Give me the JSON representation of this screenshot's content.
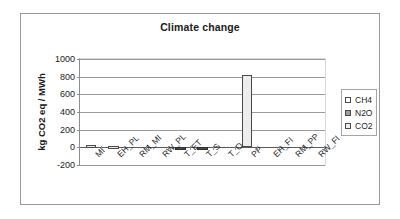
{
  "chart_data": {
    "type": "bar",
    "title": "Climate change",
    "xlabel": "",
    "ylabel": "kg CO2 eq / MWh",
    "ylim": [
      -200,
      1000
    ],
    "yticks": [
      1000,
      800,
      600,
      400,
      200,
      0,
      -200
    ],
    "grid": true,
    "legend_position": "right",
    "categories": [
      "MI",
      "EH_PL",
      "RM_MI",
      "RW_PL",
      "T_ET",
      "T_S",
      "T_O",
      "PP",
      "EH_FI",
      "RM_PP",
      "RW_FI"
    ],
    "series": [
      {
        "name": "CH4",
        "color": "#ffffff",
        "values": [
          0,
          0,
          0,
          0,
          0,
          0,
          0,
          0,
          0,
          0,
          0
        ]
      },
      {
        "name": "N2O",
        "color": "#9e9e9e",
        "values": [
          0,
          0,
          0,
          0,
          0,
          0,
          0,
          0,
          0,
          0,
          0
        ]
      },
      {
        "name": "CO2",
        "color": "#ededed",
        "values": [
          25,
          15,
          0,
          0,
          -10,
          -10,
          0,
          820,
          0,
          0,
          0
        ]
      }
    ]
  },
  "legend": {
    "items": [
      {
        "label": "CH4",
        "color": "#ffffff"
      },
      {
        "label": "N2O",
        "color": "#9e9e9e"
      },
      {
        "label": "CO2",
        "color": "#ededed"
      }
    ]
  }
}
